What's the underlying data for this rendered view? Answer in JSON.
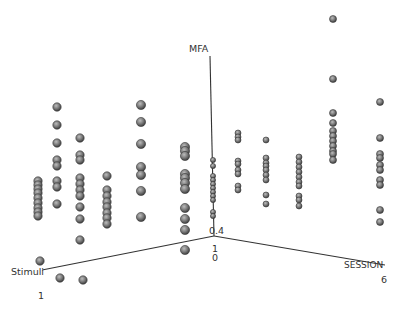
{
  "chart_data": {
    "type": "scatter",
    "subtype": "3d",
    "title": "",
    "axes": {
      "z": {
        "label": "MFA",
        "tick_min": "0.4"
      },
      "x": {
        "label": "Stimuli",
        "tick_min": "1"
      },
      "y": {
        "label": "SESSION",
        "tick_min": "0",
        "tick_max": "6"
      },
      "origin_extra_tick": "1"
    },
    "grid": false,
    "legend": null,
    "marker": {
      "color": "#7a7a7a",
      "edge": "#3a3a3a"
    },
    "columns_px": [
      {
        "x": 38,
        "y": [
          181,
          185,
          189,
          193,
          198,
          203,
          208,
          212,
          216
        ]
      },
      {
        "x": 57,
        "y": [
          107,
          125,
          143,
          160,
          166,
          181,
          187,
          204
        ]
      },
      {
        "x": 80,
        "y": [
          138,
          155,
          160,
          178,
          184,
          190,
          196,
          207,
          219,
          240
        ]
      },
      {
        "x": 107,
        "y": [
          176,
          190,
          196,
          202,
          207,
          213,
          218,
          224
        ]
      },
      {
        "x": 141,
        "y": [
          105,
          122,
          144,
          167,
          175,
          191,
          217
        ]
      },
      {
        "x": 185,
        "y": [
          147,
          151,
          156,
          174,
          178,
          183,
          189,
          208,
          219,
          230,
          250
        ]
      },
      {
        "x": 213,
        "y": [
          160,
          166,
          176,
          180,
          184,
          188,
          192,
          196,
          200,
          212,
          216
        ]
      },
      {
        "x": 238,
        "y": [
          133,
          137,
          140,
          161,
          164,
          170,
          174,
          186,
          190
        ]
      },
      {
        "x": 266,
        "y": [
          140,
          158,
          163,
          166,
          170,
          175,
          180,
          195,
          204
        ]
      },
      {
        "x": 299,
        "y": [
          157,
          162,
          167,
          172,
          177,
          182,
          186,
          196,
          200,
          206
        ]
      },
      {
        "x": 333,
        "y": [
          19,
          79,
          113,
          123,
          131,
          136,
          141,
          146,
          151,
          154,
          160
        ]
      },
      {
        "x": 380,
        "y": [
          102,
          138,
          154,
          158,
          165,
          170,
          180,
          185,
          210,
          222
        ]
      },
      {
        "x": 40,
        "y": [
          261
        ]
      },
      {
        "x": 60,
        "y": [
          278
        ]
      },
      {
        "x": 83,
        "y": [
          280
        ]
      }
    ],
    "sizes_px": {
      "near": 4.2,
      "mid": 3.5,
      "far": 3
    }
  },
  "labels": {
    "mfa": "MFA",
    "stimuli": "Stimuli",
    "session": "SESSION",
    "origin_04": "0.4",
    "origin_1": "1",
    "origin_0": "0",
    "stimuli_1": "1",
    "session_6": "6"
  }
}
